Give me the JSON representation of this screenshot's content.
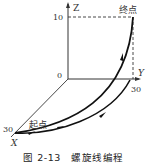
{
  "figure": {
    "caption": "图 2-13　螺旋线编程",
    "axes": {
      "z_label": "Z",
      "y_label": "Y",
      "x_label": "X",
      "origin_label": "0",
      "z_tick": "10",
      "y_tick": "30",
      "x_tick": "30"
    },
    "points": {
      "start_label": "起点",
      "end_label": "终点"
    },
    "colors": {
      "line": "#111111",
      "axis": "#333333",
      "background": "#ffffff"
    }
  }
}
